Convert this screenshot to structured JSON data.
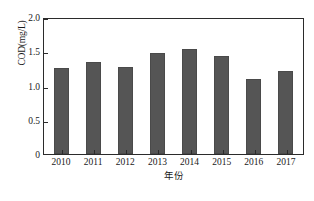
{
  "chart_data": {
    "type": "bar",
    "title": "",
    "subtitle": "",
    "xlabel": "年份",
    "ylabel": "COD(mg/L)",
    "categories": [
      "2010",
      "2011",
      "2012",
      "2013",
      "2014",
      "2015",
      "2016",
      "2017"
    ],
    "values": [
      1.25,
      1.34,
      1.27,
      1.47,
      1.54,
      1.43,
      1.09,
      1.21
    ],
    "series": [
      {
        "name": "COD",
        "values": [
          1.25,
          1.34,
          1.27,
          1.47,
          1.54,
          1.43,
          1.09,
          1.21
        ]
      }
    ],
    "ylim": [
      0,
      2.0
    ],
    "y_ticks": [
      "0",
      "0.5",
      "1.0",
      "1.5",
      "2.0"
    ],
    "y_tick_values": [
      0,
      0.5,
      1.0,
      1.5,
      2.0
    ],
    "grid": false,
    "legend": false,
    "legend_position": "none",
    "bar_color": "#555555",
    "axis_color": "#2b2b2b",
    "background_color": "#ffffff"
  }
}
